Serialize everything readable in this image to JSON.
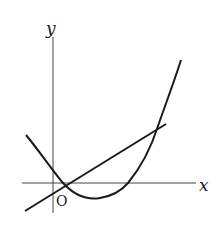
{
  "diagram": {
    "type": "function-graph",
    "axes": {
      "x_label": "x",
      "y_label": "y",
      "origin_label": "O"
    },
    "curves": [
      {
        "name": "parabola",
        "kind": "quadratic",
        "description": "upward-opening parabola crossing x-axis at two positive points near origin and right"
      },
      {
        "name": "line",
        "kind": "linear",
        "description": "straight line with positive slope intersecting the parabola at two points"
      }
    ],
    "colors": {
      "stroke": "#1a1a1a",
      "axis": "#333333",
      "background": "#ffffff"
    }
  }
}
